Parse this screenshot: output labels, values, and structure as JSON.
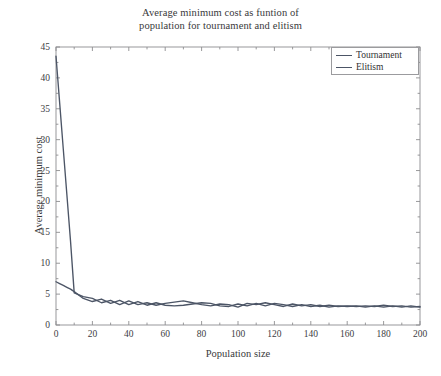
{
  "chart_data": {
    "type": "line",
    "title": "Average minimum cost as funtion of\npopulation for tournament and elitism",
    "title_line1": "Average minimum cost as funtion of",
    "title_line2": "population for tournament and elitism",
    "xlabel": "Population size",
    "ylabel": "Average minimum cost",
    "xlim": [
      0,
      200
    ],
    "ylim": [
      0,
      45
    ],
    "xticks": [
      0,
      20,
      40,
      60,
      80,
      100,
      120,
      140,
      160,
      180,
      200
    ],
    "yticks": [
      0,
      5,
      10,
      15,
      20,
      25,
      30,
      35,
      40,
      45
    ],
    "grid": false,
    "legend_position": "top-right",
    "frame": "box",
    "tick_direction": "in",
    "series": [
      {
        "name": "Tournament",
        "color": "#4c5566",
        "x": [
          0,
          2,
          4,
          6,
          8,
          10,
          15,
          20,
          25,
          30,
          35,
          40,
          45,
          50,
          55,
          60,
          65,
          70,
          75,
          80,
          85,
          90,
          95,
          100,
          105,
          110,
          115,
          120,
          125,
          130,
          135,
          140,
          145,
          150,
          155,
          160,
          165,
          170,
          175,
          180,
          185,
          190,
          195,
          200
        ],
        "values": [
          43.5,
          36.0,
          28.5,
          21.0,
          13.5,
          5.2,
          4.6,
          4.3,
          3.6,
          4.0,
          3.3,
          3.9,
          3.3,
          3.6,
          3.2,
          3.5,
          3.7,
          3.9,
          3.6,
          3.3,
          3.1,
          3.4,
          3.3,
          2.9,
          3.5,
          3.3,
          3.6,
          3.3,
          3.0,
          3.4,
          3.1,
          3.3,
          3.0,
          3.2,
          3.0,
          3.1,
          3.0,
          3.1,
          3.0,
          3.2,
          3.0,
          3.1,
          2.9,
          3.0
        ]
      },
      {
        "name": "Elitism",
        "color": "#4c5566",
        "x": [
          0,
          2,
          4,
          6,
          8,
          10,
          15,
          20,
          25,
          30,
          35,
          40,
          45,
          50,
          55,
          60,
          65,
          70,
          75,
          80,
          85,
          90,
          95,
          100,
          105,
          110,
          115,
          120,
          125,
          130,
          135,
          140,
          145,
          150,
          155,
          160,
          165,
          170,
          175,
          180,
          185,
          190,
          195,
          200
        ],
        "values": [
          7.0,
          6.7,
          6.4,
          6.1,
          5.8,
          5.4,
          4.3,
          3.8,
          4.2,
          3.5,
          4.0,
          3.3,
          3.8,
          3.2,
          3.6,
          3.2,
          3.1,
          3.2,
          3.4,
          3.6,
          3.5,
          3.1,
          3.0,
          3.4,
          3.1,
          3.5,
          3.1,
          3.5,
          3.3,
          3.0,
          3.3,
          3.0,
          3.2,
          2.9,
          3.1,
          3.0,
          3.1,
          2.9,
          3.1,
          2.9,
          3.1,
          2.9,
          3.1,
          2.9
        ]
      }
    ]
  },
  "legend": {
    "items": [
      {
        "label": "Tournament"
      },
      {
        "label": "Elitism"
      }
    ]
  },
  "axes": {
    "x_tick_labels": [
      "0",
      "20",
      "40",
      "60",
      "80",
      "100",
      "120",
      "140",
      "160",
      "180",
      "200"
    ],
    "y_tick_labels": [
      "0",
      "5",
      "10",
      "15",
      "20",
      "25",
      "30",
      "35",
      "40",
      "45"
    ]
  },
  "colors": {
    "line": "#4c5566",
    "frame": "#8d8d90",
    "text": "#39393b",
    "background": "#ffffff"
  }
}
